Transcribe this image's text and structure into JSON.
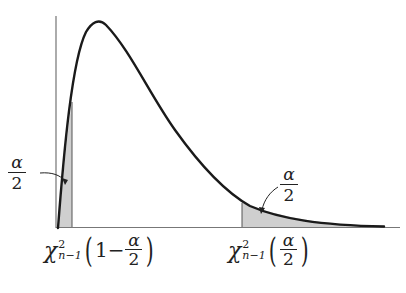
{
  "figure": {
    "colors": {
      "curve": "#1a1a1a",
      "axis": "#777777",
      "shade": "#cfcfcf"
    }
  },
  "annotations": {
    "left_tail_area": {
      "numerator": "α",
      "denominator": "2"
    },
    "right_tail_area": {
      "numerator": "α",
      "denominator": "2"
    }
  },
  "x_labels": {
    "left": {
      "symbol": "χ",
      "superscript": "2",
      "subscript": "n−1",
      "arg_prefix": "1−",
      "arg_numerator": "α",
      "arg_denominator": "2"
    },
    "right": {
      "symbol": "χ",
      "superscript": "2",
      "subscript": "n−1",
      "arg_numerator": "α",
      "arg_denominator": "2"
    }
  }
}
